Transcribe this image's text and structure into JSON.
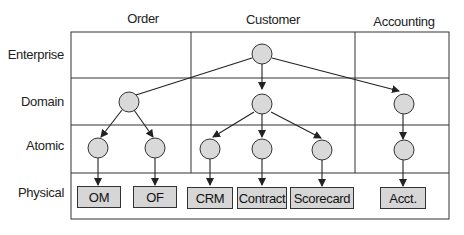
{
  "columns": [
    "Order",
    "Customer",
    "Accounting"
  ],
  "rows": [
    "Enterprise",
    "Domain",
    "Atomic",
    "Physical"
  ],
  "physical_systems": [
    "OM",
    "OF",
    "CRM",
    "Contract",
    "Scorecard",
    "Acct."
  ],
  "colors": {
    "node_fill": "#d9d9d9",
    "box_fill": "#d6d6d6",
    "line": "#222222"
  }
}
